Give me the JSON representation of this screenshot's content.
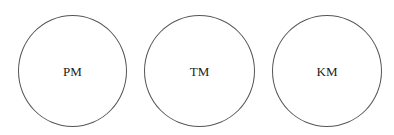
{
  "diagram": {
    "nodes": [
      {
        "id": "pm",
        "label": "PM",
        "shape": "circle"
      },
      {
        "id": "tm",
        "label": "TM",
        "shape": "circle"
      },
      {
        "id": "km",
        "label": "KM",
        "shape": "circle"
      }
    ],
    "stroke_color": "#555555",
    "background_color": "#ffffff"
  }
}
